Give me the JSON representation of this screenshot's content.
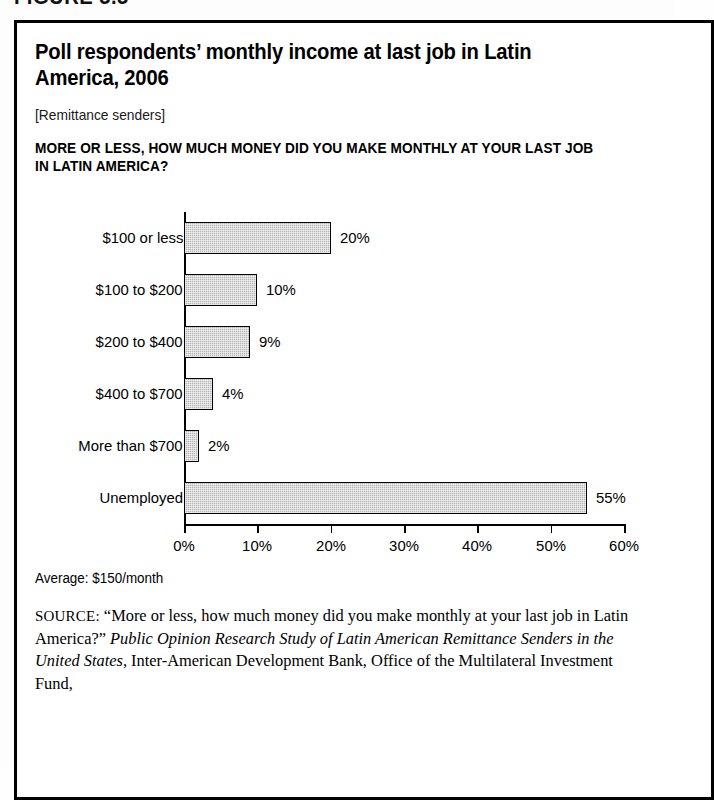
{
  "figure": {
    "number": "FIGURE 5.5"
  },
  "card": {
    "title": "Poll respondents’ monthly income at last job in Latin America, 2006",
    "bracket_note": "[Remittance senders]",
    "question": "MORE OR LESS, HOW MUCH MONEY DID YOU MAKE MONTHLY AT YOUR LAST JOB IN LATIN AMERICA?",
    "average_note": "Average: $150/month"
  },
  "source": {
    "label": "SOURCE:",
    "quote": "“More or less, how much money did you make monthly at your last job in Latin America?”",
    "italic_title": "Public Opinion Research Study of Latin American Remittance Senders in the United States",
    "tail": ", Inter-American Development Bank, Office of the Multilateral Investment Fund,"
  },
  "chart_data": {
    "type": "bar",
    "orientation": "horizontal",
    "title": "Poll respondents’ monthly income at last job in Latin America, 2006",
    "subtitle": "[Remittance senders]",
    "xlabel": "",
    "ylabel": "",
    "xlim": [
      0,
      60
    ],
    "grid": false,
    "legend": "none",
    "categories": [
      "$100 or less",
      "$100 to $200",
      "$200 to $400",
      "$400 to $700",
      "More than $700",
      "Unemployed"
    ],
    "values": [
      20,
      10,
      9,
      4,
      2,
      55
    ],
    "value_labels": [
      "20%",
      "10%",
      "9%",
      "4%",
      "2%",
      "55%"
    ],
    "xticks": [
      0,
      10,
      20,
      30,
      40,
      50,
      60
    ],
    "xtick_labels": [
      "0%",
      "10%",
      "20%",
      "30%",
      "40%",
      "50%",
      "60%"
    ],
    "annotation": "Average: $150/month",
    "bar_fill": "#b4b4b4",
    "bar_stroke": "#000000"
  }
}
